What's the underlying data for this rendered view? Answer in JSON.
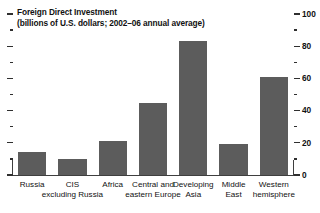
{
  "chart_data": {
    "type": "bar",
    "title": "Foreign Direct Investment",
    "subtitle": "(billions of U.S. dollars; 2002–06 annual average)",
    "xlabel": "",
    "ylabel": "",
    "ylim": [
      0,
      100
    ],
    "y_axis_position": "right",
    "grid": false,
    "legend": "none",
    "bar_color": "#5c5c5c",
    "y_major_ticks": [
      0,
      20,
      40,
      60,
      80,
      100
    ],
    "y_minor_ticks": [
      10,
      30,
      50,
      70,
      90
    ],
    "tick_labels": [
      "0",
      "20",
      "40",
      "60",
      "80",
      "100"
    ],
    "categories": [
      "Russia",
      "CIS excluding Russia",
      "Africa",
      "Central and eastern Europe",
      "Developing Asia",
      "Middle East",
      "Western hemisphere"
    ],
    "category_label_lines": [
      [
        "Russia",
        ""
      ],
      [
        "CIS",
        "excluding Russia"
      ],
      [
        "Africa",
        ""
      ],
      [
        "Central and",
        "eastern Europe"
      ],
      [
        "Developing",
        "Asia"
      ],
      [
        "Middle",
        "East"
      ],
      [
        "Western",
        "hemisphere"
      ]
    ],
    "values": [
      14,
      10,
      21,
      45,
      83,
      19,
      61
    ]
  }
}
